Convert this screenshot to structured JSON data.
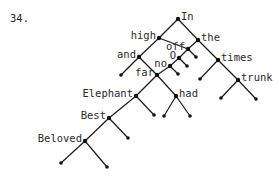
{
  "figure_number": "34.",
  "tree": {
    "nodes": [
      {
        "id": "in",
        "label": "In",
        "side": "right"
      },
      {
        "id": "high",
        "label": "high",
        "side": "left"
      },
      {
        "id": "the",
        "label": "the",
        "side": "right"
      },
      {
        "id": "off",
        "label": "off",
        "side": "left"
      },
      {
        "id": "o",
        "label": "O",
        "side": "left"
      },
      {
        "id": "no",
        "label": "no",
        "side": "left"
      },
      {
        "id": "and",
        "label": "and",
        "side": "left"
      },
      {
        "id": "far",
        "label": "far",
        "side": "left"
      },
      {
        "id": "times",
        "label": "times",
        "side": "right"
      },
      {
        "id": "trunk",
        "label": "trunk",
        "side": "right"
      },
      {
        "id": "elephant",
        "label": "Elephant",
        "side": "left"
      },
      {
        "id": "had",
        "label": "had",
        "side": "right"
      },
      {
        "id": "best",
        "label": "Best",
        "side": "left"
      },
      {
        "id": "beloved",
        "label": "Beloved",
        "side": "left"
      },
      {
        "id": "leaf_and",
        "label": ""
      },
      {
        "id": "leaf_off",
        "label": ""
      },
      {
        "id": "leaf_o",
        "label": ""
      },
      {
        "id": "leaf_no",
        "label": ""
      },
      {
        "id": "leaf_times",
        "label": ""
      },
      {
        "id": "leaf_trunk_l",
        "label": ""
      },
      {
        "id": "leaf_trunk_r",
        "label": ""
      },
      {
        "id": "leaf_elephant",
        "label": ""
      },
      {
        "id": "leaf_had_l",
        "label": ""
      },
      {
        "id": "leaf_had_r",
        "label": ""
      },
      {
        "id": "leaf_best",
        "label": ""
      },
      {
        "id": "leaf_beloved_l",
        "label": ""
      },
      {
        "id": "leaf_beloved_r",
        "label": ""
      }
    ],
    "edges": [
      [
        "in",
        "high"
      ],
      [
        "in",
        "the"
      ],
      [
        "high",
        "and"
      ],
      [
        "high",
        "off"
      ],
      [
        "the",
        "off"
      ],
      [
        "the",
        "times"
      ],
      [
        "off",
        "o"
      ],
      [
        "off",
        "leaf_off"
      ],
      [
        "o",
        "no"
      ],
      [
        "o",
        "leaf_o"
      ],
      [
        "no",
        "far"
      ],
      [
        "no",
        "leaf_no"
      ],
      [
        "and",
        "leaf_and"
      ],
      [
        "and",
        "far"
      ],
      [
        "far",
        "elephant"
      ],
      [
        "far",
        "had"
      ],
      [
        "times",
        "leaf_times"
      ],
      [
        "times",
        "trunk"
      ],
      [
        "trunk",
        "leaf_trunk_l"
      ],
      [
        "trunk",
        "leaf_trunk_r"
      ],
      [
        "elephant",
        "best"
      ],
      [
        "elephant",
        "leaf_elephant"
      ],
      [
        "had",
        "leaf_had_l"
      ],
      [
        "had",
        "leaf_had_r"
      ],
      [
        "best",
        "beloved"
      ],
      [
        "best",
        "leaf_best"
      ],
      [
        "beloved",
        "leaf_beloved_l"
      ],
      [
        "beloved",
        "leaf_beloved_r"
      ]
    ]
  }
}
